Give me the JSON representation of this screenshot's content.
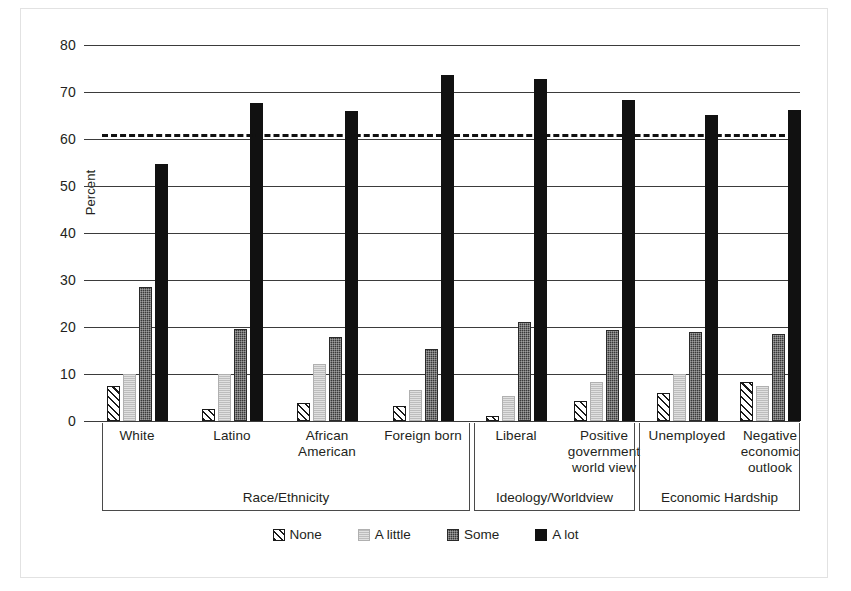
{
  "chart_data": {
    "type": "bar",
    "title": "",
    "xlabel": "",
    "ylabel": "Percent",
    "ylim": [
      0,
      80
    ],
    "yticks": [
      0,
      10,
      20,
      30,
      40,
      50,
      60,
      70,
      80
    ],
    "grid": true,
    "legend_position": "bottom",
    "categories": [
      "White",
      "Latino",
      "African American",
      "Foreign born",
      "Liberal",
      "Positive government world view",
      "Unemployed",
      "Negative economic outlook"
    ],
    "series": [
      {
        "name": "None",
        "values": [
          7.5,
          2.5,
          3.9,
          3.3,
          1.0,
          4.3,
          6.0,
          8.2
        ]
      },
      {
        "name": "A little",
        "values": [
          10.0,
          10.0,
          12.2,
          6.7,
          5.3,
          8.4,
          10.0,
          7.4
        ]
      },
      {
        "name": "Some",
        "values": [
          28.5,
          19.6,
          17.8,
          15.3,
          21.0,
          19.4,
          18.9,
          18.6
        ]
      },
      {
        "name": "A lot",
        "values": [
          54.6,
          67.7,
          66.0,
          73.7,
          72.8,
          68.4,
          65.1,
          66.2
        ]
      }
    ],
    "annotations": [
      {
        "name": "reference-line",
        "type": "hline",
        "value": 61.0,
        "style": "dashed"
      }
    ],
    "groups": [
      {
        "label": "Race/Ethnicity",
        "categories": [
          "White",
          "Latino",
          "African American",
          "Foreign born"
        ]
      },
      {
        "label": "Ideology/Worldview",
        "categories": [
          "Liberal",
          "Positive government world view"
        ]
      },
      {
        "label": "Economic Hardship",
        "categories": [
          "Unemployed",
          "Negative economic outlook"
        ]
      }
    ]
  },
  "axis": {
    "y_title": "Percent",
    "ticks": {
      "t0": "0",
      "t10": "10",
      "t20": "20",
      "t30": "30",
      "t40": "40",
      "t50": "50",
      "t60": "60",
      "t70": "70",
      "t80": "80"
    }
  },
  "categories": {
    "c0_l1": "White",
    "c0_l2": "",
    "c1_l1": "Latino",
    "c1_l2": "",
    "c2_l1": "African",
    "c2_l2": "American",
    "c2_l3": "",
    "c3_l1": "Foreign born",
    "c3_l2": "",
    "c4_l1": "Liberal",
    "c4_l2": "",
    "c5_l1": "Positive",
    "c5_l2": "government",
    "c5_l3": "world view",
    "c6_l1": "Unemployed",
    "c6_l2": "",
    "c7_l1": "Negative",
    "c7_l2": "economic",
    "c7_l3": "outlook"
  },
  "groups": {
    "g0": "Race/Ethnicity",
    "g1": "Ideology/Worldview",
    "g2": "Economic Hardship"
  },
  "legend": {
    "items": [
      {
        "label": "None",
        "swatch": "hatched-swatch"
      },
      {
        "label": "A little",
        "swatch": "light-gray-swatch"
      },
      {
        "label": "Some",
        "swatch": "dark-gray-swatch"
      },
      {
        "label": "A lot",
        "swatch": "black-swatch"
      }
    ]
  },
  "colors": {
    "none": "#ffffff",
    "a_little": "#bdbdbd",
    "some": "#3a3a3a",
    "a_lot": "#111111",
    "axis": "#3b3b3b"
  }
}
